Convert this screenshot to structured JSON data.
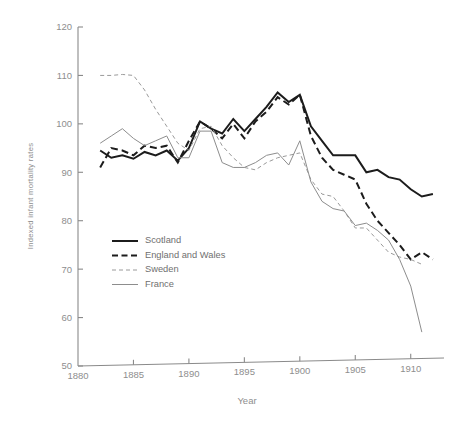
{
  "chart_data": {
    "type": "line",
    "title": "",
    "xlabel": "Year",
    "ylabel": "Indexed infant mortality rates",
    "xlim": [
      1880,
      1913
    ],
    "ylim": [
      50,
      120
    ],
    "xticks": [
      1880,
      1885,
      1890,
      1895,
      1900,
      1905,
      1910
    ],
    "yticks": [
      50,
      60,
      70,
      80,
      90,
      100,
      110,
      120
    ],
    "grid": false,
    "legend_position": "center-left",
    "series": [
      {
        "name": "Scotland",
        "style": "thick-solid",
        "color": "#1c1c1c",
        "x": [
          1882,
          1883,
          1884,
          1885,
          1886,
          1887,
          1888,
          1889,
          1890,
          1891,
          1892,
          1893,
          1894,
          1895,
          1896,
          1897,
          1898,
          1899,
          1900,
          1901,
          1902,
          1903,
          1904,
          1905,
          1906,
          1907,
          1908,
          1909,
          1910,
          1911,
          1912
        ],
        "values": [
          94.5,
          93.0,
          93.5,
          92.8,
          94.2,
          93.5,
          94.5,
          92.4,
          95.0,
          100.5,
          99.0,
          98.0,
          101.0,
          98.5,
          101.0,
          103.5,
          106.5,
          104.5,
          106.0,
          99.5,
          96.5,
          93.5,
          93.5,
          93.5,
          90.0,
          90.5,
          89.0,
          88.5,
          86.5,
          85.0,
          85.5
        ]
      },
      {
        "name": "England and Wales",
        "style": "thick-dashed",
        "color": "#1c1c1c",
        "x": [
          1882,
          1883,
          1884,
          1885,
          1886,
          1887,
          1888,
          1889,
          1890,
          1891,
          1892,
          1893,
          1894,
          1895,
          1896,
          1897,
          1898,
          1899,
          1900,
          1901,
          1902,
          1903,
          1904,
          1905,
          1906,
          1907,
          1908,
          1909,
          1910,
          1911,
          1912
        ],
        "values": [
          91.0,
          95.0,
          94.5,
          93.5,
          95.5,
          95.0,
          95.5,
          92.0,
          96.5,
          100.5,
          99.0,
          97.0,
          100.0,
          97.0,
          100.5,
          102.5,
          105.5,
          104.0,
          106.0,
          97.5,
          93.0,
          90.5,
          89.5,
          88.5,
          83.5,
          80.0,
          77.5,
          75.0,
          72.0,
          73.5,
          72.0
        ]
      },
      {
        "name": "Sweden",
        "style": "thin-dashed",
        "color": "#9a9a9a",
        "x": [
          1882,
          1883,
          1884,
          1885,
          1886,
          1887,
          1888,
          1889,
          1890,
          1891,
          1892,
          1893,
          1894,
          1895,
          1896,
          1897,
          1898,
          1899,
          1900,
          1901,
          1902,
          1903,
          1904,
          1905,
          1906,
          1907,
          1908,
          1909,
          1910,
          1911
        ],
        "values": [
          110.0,
          110.0,
          110.2,
          110.0,
          107.0,
          103.0,
          99.5,
          96.0,
          94.5,
          99.0,
          99.5,
          95.5,
          93.0,
          91.0,
          90.5,
          92.0,
          93.0,
          93.5,
          94.0,
          88.5,
          85.5,
          85.0,
          82.0,
          78.5,
          78.5,
          76.0,
          73.5,
          72.5,
          72.0,
          71.0
        ]
      },
      {
        "name": "France",
        "style": "thin-solid",
        "color": "#8d8d8d",
        "x": [
          1882,
          1883,
          1884,
          1885,
          1886,
          1887,
          1888,
          1889,
          1890,
          1891,
          1892,
          1893,
          1894,
          1895,
          1896,
          1897,
          1898,
          1899,
          1900,
          1901,
          1902,
          1903,
          1904,
          1905,
          1906,
          1907,
          1908,
          1909,
          1910,
          1911
        ],
        "values": [
          96.0,
          97.5,
          99.0,
          97.0,
          95.5,
          96.5,
          97.5,
          93.0,
          93.0,
          98.5,
          98.5,
          92.0,
          91.0,
          91.0,
          92.0,
          93.5,
          94.0,
          91.5,
          96.5,
          88.0,
          84.0,
          82.5,
          82.0,
          79.0,
          79.5,
          78.0,
          76.0,
          72.0,
          66.5,
          57.0
        ]
      }
    ]
  },
  "legend": {
    "items": [
      {
        "label": "Scotland"
      },
      {
        "label": "England and Wales"
      },
      {
        "label": "Sweden"
      },
      {
        "label": "France"
      }
    ]
  },
  "axis": {
    "x_title": "Year",
    "y_title": "Indexed infant mortality rates",
    "x_tick_labels": [
      "1880",
      "1885",
      "1890",
      "1895",
      "1900",
      "1905",
      "1910"
    ],
    "y_tick_labels": [
      "50",
      "60",
      "70",
      "80",
      "90",
      "100",
      "110",
      "120"
    ]
  },
  "colors": {
    "axis": "#8a8a8a",
    "tick_text": "#8e8e8e",
    "dark_series": "#1c1c1c",
    "light_series": "#8d8d8d"
  }
}
